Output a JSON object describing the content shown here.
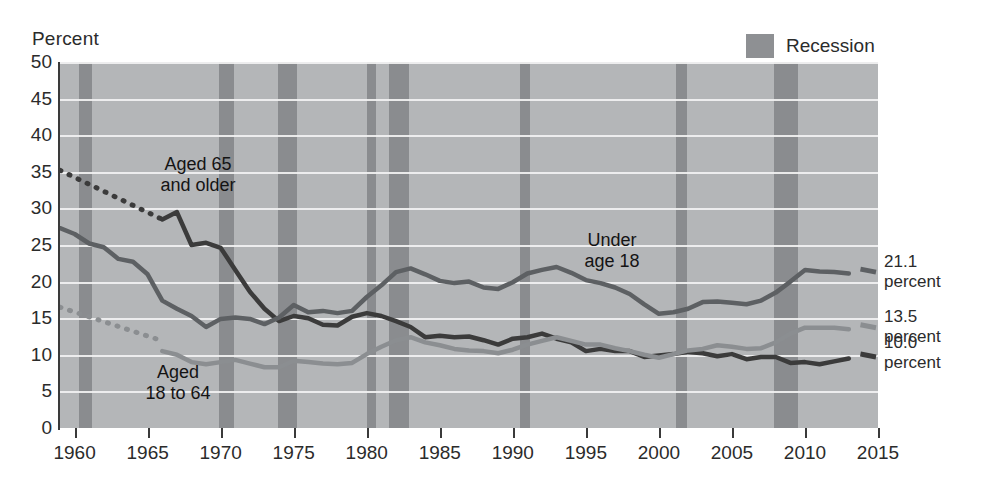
{
  "axis": {
    "y_title": "Percent",
    "y_ticks": [
      0,
      5,
      10,
      15,
      20,
      25,
      30,
      35,
      40,
      45,
      50
    ],
    "x_ticks": [
      1960,
      1965,
      1970,
      1975,
      1980,
      1985,
      1990,
      1995,
      2000,
      2005,
      2010,
      2015
    ]
  },
  "legend": {
    "recession_label": "Recession",
    "recession_color": "#8a8c8f"
  },
  "annotations": {
    "aged65": "Aged 65\nand older",
    "aged65_line1": "Aged 65",
    "aged65_line2": "and older",
    "under18_line1": "Under",
    "under18_line2": "age 18",
    "aged18to64_line1": "Aged",
    "aged18to64_line2": "18 to 64"
  },
  "end_labels": [
    {
      "value": "21.1",
      "unit": "percent",
      "series": "Under age 18"
    },
    {
      "value": "13.5",
      "unit": "percent",
      "series": "Aged 18 to 64"
    },
    {
      "value": "10.0",
      "unit": "percent",
      "series": "Aged 65 and older"
    }
  ],
  "chart_data": {
    "type": "line",
    "title": "",
    "xlabel": "",
    "ylabel": "Percent",
    "xlim": [
      1959,
      2015
    ],
    "ylim": [
      0,
      50
    ],
    "grid": true,
    "legend_position": "top-right",
    "plot_background": "#b4b6b8",
    "gridline_color": "#f2f2f2",
    "recession_bands": [
      [
        1960.3,
        1961.2
      ],
      [
        1969.9,
        1970.9
      ],
      [
        1973.9,
        1975.2
      ],
      [
        1980.0,
        1980.6
      ],
      [
        1981.5,
        1982.9
      ],
      [
        1990.5,
        1991.2
      ],
      [
        2001.2,
        2001.9
      ],
      [
        2007.9,
        2009.5
      ]
    ],
    "series": [
      {
        "name": "Aged 65 and older",
        "color": "#3b3b3b",
        "style": "solid-with-dotted-lead",
        "dotted_x": [
          1959,
          1966
        ],
        "dotted_y": [
          35.2,
          28.5
        ],
        "x": [
          1966,
          1967,
          1968,
          1969,
          1970,
          1971,
          1972,
          1973,
          1974,
          1975,
          1976,
          1977,
          1978,
          1979,
          1980,
          1981,
          1982,
          1983,
          1984,
          1985,
          1986,
          1987,
          1988,
          1989,
          1990,
          1991,
          1992,
          1993,
          1994,
          1995,
          1996,
          1997,
          1998,
          1999,
          2000,
          2001,
          2002,
          2003,
          2004,
          2005,
          2006,
          2007,
          2008,
          2009,
          2010,
          2011,
          2012,
          2013
        ],
        "y": [
          28.5,
          29.5,
          25.0,
          25.3,
          24.6,
          21.6,
          18.6,
          16.3,
          14.6,
          15.3,
          15.0,
          14.1,
          14.0,
          15.2,
          15.7,
          15.3,
          14.6,
          13.8,
          12.4,
          12.6,
          12.4,
          12.5,
          12.0,
          11.4,
          12.2,
          12.4,
          12.9,
          12.2,
          11.7,
          10.5,
          10.8,
          10.5,
          10.5,
          9.7,
          9.9,
          10.1,
          10.4,
          10.2,
          9.8,
          10.1,
          9.4,
          9.7,
          9.7,
          8.9,
          9.0,
          8.7,
          9.1,
          9.5
        ],
        "end_value": 10.0
      },
      {
        "name": "Under age 18",
        "color": "#5d6063",
        "style": "solid",
        "x": [
          1959,
          1960,
          1961,
          1962,
          1963,
          1964,
          1965,
          1966,
          1967,
          1968,
          1969,
          1970,
          1971,
          1972,
          1973,
          1974,
          1975,
          1976,
          1977,
          1978,
          1979,
          1980,
          1981,
          1982,
          1983,
          1984,
          1985,
          1986,
          1987,
          1988,
          1989,
          1990,
          1991,
          1992,
          1993,
          1994,
          1995,
          1996,
          1997,
          1998,
          1999,
          2000,
          2001,
          2002,
          2003,
          2004,
          2005,
          2006,
          2007,
          2008,
          2009,
          2010,
          2011,
          2012,
          2013
        ],
        "y": [
          27.3,
          26.5,
          25.2,
          24.7,
          23.1,
          22.7,
          21.0,
          17.4,
          16.3,
          15.3,
          13.8,
          14.9,
          15.1,
          14.9,
          14.2,
          15.1,
          16.8,
          15.8,
          16.0,
          15.7,
          16.0,
          17.9,
          19.5,
          21.3,
          21.8,
          21.0,
          20.1,
          19.8,
          20.0,
          19.2,
          19.0,
          19.9,
          21.1,
          21.6,
          22.0,
          21.2,
          20.2,
          19.8,
          19.2,
          18.3,
          16.9,
          15.6,
          15.8,
          16.3,
          17.2,
          17.3,
          17.1,
          16.9,
          17.4,
          18.5,
          20.0,
          21.6,
          21.4,
          21.3,
          21.1
        ],
        "end_value": 21.1
      },
      {
        "name": "Aged 18 to 64",
        "color": "#8b8e91",
        "style": "solid-with-dotted-lead",
        "dotted_x": [
          1959,
          1966
        ],
        "dotted_y": [
          16.5,
          11.9
        ],
        "x": [
          1966,
          1967,
          1968,
          1969,
          1970,
          1971,
          1972,
          1973,
          1974,
          1975,
          1976,
          1977,
          1978,
          1979,
          1980,
          1981,
          1982,
          1983,
          1984,
          1985,
          1986,
          1987,
          1988,
          1989,
          1990,
          1991,
          1992,
          1993,
          1994,
          1995,
          1996,
          1997,
          1998,
          1999,
          2000,
          2001,
          2002,
          2003,
          2004,
          2005,
          2006,
          2007,
          2008,
          2009,
          2010,
          2011,
          2012,
          2013
        ],
        "y": [
          10.5,
          10.0,
          9.0,
          8.7,
          9.0,
          9.3,
          8.8,
          8.3,
          8.3,
          9.2,
          9.0,
          8.8,
          8.7,
          8.9,
          10.1,
          11.1,
          12.0,
          12.4,
          11.7,
          11.3,
          10.8,
          10.6,
          10.5,
          10.2,
          10.7,
          11.4,
          11.9,
          12.4,
          11.9,
          11.4,
          11.4,
          10.9,
          10.5,
          10.0,
          9.6,
          10.1,
          10.6,
          10.8,
          11.3,
          11.1,
          10.8,
          10.9,
          11.7,
          12.9,
          13.7,
          13.7,
          13.7,
          13.5
        ],
        "end_value": 13.5
      }
    ]
  }
}
